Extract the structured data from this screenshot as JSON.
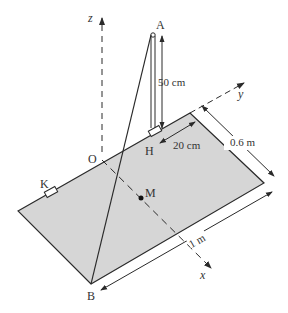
{
  "diagram": {
    "type": "physics-3d-plate",
    "colors": {
      "plate_fill": "#d6d6d6",
      "line": "#2a2a2a",
      "text": "#333333"
    },
    "axes": {
      "x": "x",
      "y": "y",
      "z": "z"
    },
    "points": {
      "A": "A",
      "O": "O",
      "H": "H",
      "K": "K",
      "M": "M",
      "B": "B"
    },
    "dimensions": {
      "height_AH": "50 cm",
      "offset_H": "20 cm",
      "width": "0.6 m",
      "length": "1 m"
    }
  }
}
